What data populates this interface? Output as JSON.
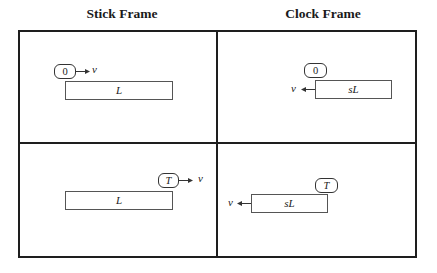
{
  "headings": {
    "left": "Stick Frame",
    "right": "Clock Frame"
  },
  "panels": {
    "top_left": {
      "clock_label": "0",
      "velocity_label": "v",
      "velocity_direction": "right",
      "stick_label": "L"
    },
    "top_right": {
      "clock_label": "0",
      "velocity_label": "v",
      "velocity_direction": "left",
      "stick_label": "sL"
    },
    "bottom_left": {
      "clock_label": "T",
      "velocity_label": "v",
      "velocity_direction": "right",
      "stick_label": "L"
    },
    "bottom_right": {
      "clock_label": "T",
      "velocity_label": "v",
      "velocity_direction": "left",
      "stick_label": "sL"
    }
  },
  "colors": {
    "frame_border": "#1e1e1e",
    "stick_border": "#555555",
    "background": "#ffffff"
  }
}
